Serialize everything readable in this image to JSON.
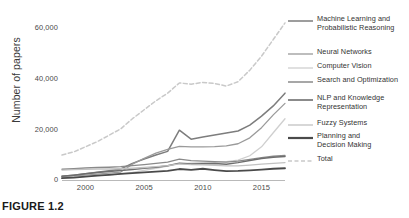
{
  "caption": "FIGURE 1.2",
  "chart_data": {
    "type": "line",
    "title": "",
    "xlabel": "",
    "ylabel": "Number of papers",
    "xlim": [
      1998,
      2017
    ],
    "ylim": [
      0,
      65000
    ],
    "grid": false,
    "legend_position": "right",
    "x_ticks": [
      2000,
      2005,
      2010,
      2015
    ],
    "x_tick_labels": [
      "2000",
      "2005",
      "2010",
      "2015"
    ],
    "y_ticks": [
      0,
      20000,
      40000,
      60000
    ],
    "y_tick_labels": [
      "0",
      "20,000",
      "40,000",
      "60,000"
    ],
    "x": [
      1998,
      1999,
      2000,
      2001,
      2002,
      2003,
      2004,
      2005,
      2006,
      2007,
      2008,
      2009,
      2010,
      2011,
      2012,
      2013,
      2014,
      2015,
      2016,
      2017
    ],
    "series": [
      {
        "name": "Machine Learning and Probabilistic Reasoning",
        "color": "#7d7d7d",
        "width": 1.5,
        "dash": "none",
        "values": [
          1500,
          1900,
          2400,
          3000,
          3600,
          4300,
          6500,
          8200,
          9800,
          11200,
          19500,
          16000,
          16800,
          17600,
          18400,
          19200,
          21500,
          25000,
          29000,
          34000
        ]
      },
      {
        "name": "Neural Networks",
        "color": "#9a9a9a",
        "width": 1.3,
        "dash": "none",
        "values": [
          1200,
          1500,
          1900,
          2300,
          2700,
          3100,
          6200,
          8500,
          10500,
          12000,
          13200,
          13000,
          13000,
          13100,
          13400,
          14200,
          16500,
          20500,
          25500,
          30000
        ]
      },
      {
        "name": "Computer Vision",
        "color": "#cfcfcf",
        "width": 1.3,
        "dash": "none",
        "values": [
          900,
          1100,
          1400,
          1700,
          2000,
          2400,
          3000,
          3800,
          4600,
          5400,
          6400,
          6600,
          6800,
          6900,
          7200,
          7800,
          9500,
          13000,
          18500,
          24000
        ]
      },
      {
        "name": "Search and Optimization",
        "color": "#8a8a8a",
        "width": 1.3,
        "dash": "none",
        "values": [
          4200,
          4400,
          4700,
          4900,
          5000,
          5200,
          5600,
          6000,
          6500,
          7000,
          8200,
          7600,
          7400,
          7200,
          7000,
          7400,
          8100,
          8800,
          9300,
          9600
        ]
      },
      {
        "name": "NLP and Knowledge Representation",
        "color": "#6e6e6e",
        "width": 1.5,
        "dash": "none",
        "values": [
          1500,
          1900,
          2400,
          2900,
          3300,
          3700,
          4100,
          4600,
          5000,
          5600,
          6600,
          6300,
          6400,
          6500,
          6200,
          6800,
          7600,
          8400,
          8900,
          9200
        ]
      },
      {
        "name": "Fuzzy Systems",
        "color": "#c2c2c2",
        "width": 1.3,
        "dash": "none",
        "values": [
          3900,
          4100,
          4200,
          4300,
          4300,
          4400,
          4600,
          4900,
          5200,
          5600,
          6300,
          6000,
          5900,
          5700,
          5500,
          5500,
          5800,
          6200,
          6500,
          6800
        ]
      },
      {
        "name": "Planning and Decision Making",
        "color": "#4a4a4a",
        "width": 1.8,
        "dash": "none",
        "values": [
          700,
          900,
          1300,
          1700,
          2000,
          2400,
          2700,
          3000,
          3300,
          3600,
          4300,
          4000,
          4400,
          3900,
          3500,
          3600,
          3800,
          4100,
          4400,
          4600
        ]
      },
      {
        "name": "Total",
        "color": "#c9c9c9",
        "width": 1.5,
        "dash": "4,2.5",
        "values": [
          9800,
          11000,
          13000,
          15000,
          17500,
          20000,
          24000,
          27500,
          31000,
          34000,
          38000,
          37500,
          38200,
          37800,
          36800,
          38500,
          43000,
          48500,
          55000,
          61500
        ]
      }
    ]
  },
  "legend": {
    "items": [
      {
        "label": "Machine Learning and\nProbabilistic Reasoning",
        "color": "#7d7d7d",
        "width": 1.5,
        "dash": "none",
        "top": 8
      },
      {
        "label": "Neural Networks",
        "color": "#9a9a9a",
        "width": 1.3,
        "dash": "none",
        "top": 41
      },
      {
        "label": "Computer Vision",
        "color": "#cfcfcf",
        "width": 1.3,
        "dash": "none",
        "top": 55
      },
      {
        "label": "Search and Optimization",
        "color": "#8a8a8a",
        "width": 1.5,
        "dash": "none",
        "top": 69
      },
      {
        "label": "NLP and Knowledge\nRepresentation",
        "color": "#6e6e6e",
        "width": 1.6,
        "dash": "none",
        "top": 87
      },
      {
        "label": "Fuzzy Systems",
        "color": "#c2c2c2",
        "width": 1.3,
        "dash": "none",
        "top": 112
      },
      {
        "label": "Planning and\nDecision Making",
        "color": "#4a4a4a",
        "width": 2.2,
        "dash": "none",
        "top": 125
      },
      {
        "label": "Total",
        "color": "#c9c9c9",
        "width": 1.5,
        "dash": "4,2.5",
        "top": 148
      }
    ]
  }
}
